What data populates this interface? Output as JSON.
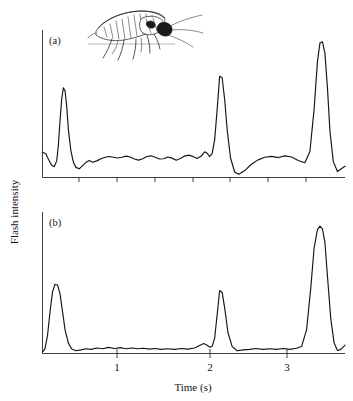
{
  "figure": {
    "background_color": "#ffffff",
    "trace_color": "#141414",
    "axis_color": "#2b2b2b",
    "y_axis_title": "Flash intensity",
    "x_axis_title": "Time (s)",
    "illustration_name": "firefly-line-drawing"
  },
  "panels": [
    {
      "id": "a",
      "label": "(a)",
      "x_tick_labels": [
        "",
        "",
        "",
        "",
        "",
        "",
        ""
      ],
      "show_tick_labels": false
    },
    {
      "id": "b",
      "label": "(b)",
      "x_tick_labels": [
        "1",
        "2",
        "3"
      ],
      "show_tick_labels": true
    }
  ],
  "chart_data": {
    "type": "line",
    "title": "",
    "xlabel": "Time (s)",
    "ylabel": "Flash intensity",
    "xlim": [
      0,
      3.62
    ],
    "ylim": [
      0,
      1.0
    ],
    "grid": false,
    "legend": null,
    "x_ticks": [
      1,
      2,
      3
    ],
    "x_tick_labels": [
      "1",
      "2",
      "3"
    ],
    "y_ticks": [],
    "y_tick_labels": [],
    "panels": [
      {
        "name": "(a)",
        "description": "Flash intensity trace with noisy baseline between flashes",
        "flash_peaks": [
          {
            "time": 0.25,
            "intensity": 0.62
          },
          {
            "time": 2.12,
            "intensity": 0.7
          },
          {
            "time": 3.35,
            "intensity": 0.94
          }
        ],
        "x": [
          0.0,
          0.04,
          0.08,
          0.11,
          0.14,
          0.17,
          0.19,
          0.21,
          0.23,
          0.25,
          0.27,
          0.29,
          0.31,
          0.34,
          0.37,
          0.4,
          0.44,
          0.48,
          0.52,
          0.56,
          0.6,
          0.65,
          0.7,
          0.75,
          0.8,
          0.85,
          0.9,
          0.95,
          1.0,
          1.05,
          1.1,
          1.15,
          1.2,
          1.25,
          1.3,
          1.35,
          1.4,
          1.45,
          1.5,
          1.55,
          1.6,
          1.65,
          1.7,
          1.75,
          1.8,
          1.85,
          1.9,
          1.94,
          1.97,
          2.0,
          2.03,
          2.06,
          2.09,
          2.12,
          2.15,
          2.18,
          2.21,
          2.25,
          2.3,
          2.35,
          2.42,
          2.5,
          2.58,
          2.66,
          2.74,
          2.82,
          2.9,
          2.98,
          3.06,
          3.14,
          3.2,
          3.25,
          3.29,
          3.32,
          3.35,
          3.38,
          3.41,
          3.44,
          3.48,
          3.53,
          3.58,
          3.62
        ],
        "y": [
          0.175,
          0.165,
          0.115,
          0.085,
          0.075,
          0.115,
          0.225,
          0.395,
          0.545,
          0.62,
          0.6,
          0.49,
          0.33,
          0.185,
          0.105,
          0.07,
          0.06,
          0.082,
          0.105,
          0.118,
          0.105,
          0.115,
          0.13,
          0.14,
          0.145,
          0.14,
          0.135,
          0.14,
          0.148,
          0.142,
          0.128,
          0.12,
          0.13,
          0.145,
          0.15,
          0.14,
          0.128,
          0.13,
          0.142,
          0.134,
          0.12,
          0.132,
          0.148,
          0.155,
          0.146,
          0.132,
          0.148,
          0.178,
          0.168,
          0.145,
          0.165,
          0.26,
          0.47,
          0.7,
          0.69,
          0.54,
          0.33,
          0.135,
          0.038,
          0.022,
          0.048,
          0.092,
          0.122,
          0.14,
          0.146,
          0.138,
          0.15,
          0.142,
          0.118,
          0.102,
          0.18,
          0.47,
          0.8,
          0.93,
          0.94,
          0.86,
          0.62,
          0.32,
          0.11,
          0.042,
          0.062,
          0.078
        ]
      },
      {
        "name": "(b)",
        "description": "Flash intensity trace with near-flat baseline between flashes",
        "flash_peaks": [
          {
            "time": 0.18,
            "intensity": 0.5
          },
          {
            "time": 2.12,
            "intensity": 0.46
          },
          {
            "time": 3.32,
            "intensity": 0.92
          }
        ],
        "x": [
          0.0,
          0.03,
          0.06,
          0.09,
          0.12,
          0.15,
          0.18,
          0.21,
          0.24,
          0.27,
          0.31,
          0.35,
          0.4,
          0.46,
          0.52,
          0.58,
          0.65,
          0.72,
          0.79,
          0.86,
          0.93,
          1.0,
          1.07,
          1.14,
          1.21,
          1.28,
          1.35,
          1.42,
          1.5,
          1.58,
          1.66,
          1.74,
          1.82,
          1.88,
          1.93,
          1.97,
          2.0,
          2.03,
          2.06,
          2.09,
          2.12,
          2.15,
          2.18,
          2.22,
          2.27,
          2.33,
          2.4,
          2.48,
          2.56,
          2.64,
          2.72,
          2.8,
          2.88,
          2.96,
          3.04,
          3.1,
          3.16,
          3.21,
          3.25,
          3.29,
          3.32,
          3.35,
          3.38,
          3.41,
          3.45,
          3.49,
          3.53,
          3.57,
          3.62
        ],
        "y": [
          0.01,
          0.035,
          0.13,
          0.3,
          0.445,
          0.5,
          0.495,
          0.43,
          0.3,
          0.17,
          0.075,
          0.032,
          0.02,
          0.026,
          0.034,
          0.03,
          0.04,
          0.034,
          0.044,
          0.036,
          0.042,
          0.034,
          0.04,
          0.034,
          0.038,
          0.032,
          0.036,
          0.03,
          0.034,
          0.03,
          0.036,
          0.032,
          0.04,
          0.058,
          0.072,
          0.06,
          0.046,
          0.052,
          0.11,
          0.28,
          0.455,
          0.44,
          0.33,
          0.15,
          0.05,
          0.02,
          0.026,
          0.03,
          0.036,
          0.03,
          0.034,
          0.03,
          0.036,
          0.03,
          0.038,
          0.05,
          0.17,
          0.47,
          0.76,
          0.895,
          0.92,
          0.9,
          0.8,
          0.56,
          0.25,
          0.075,
          0.022,
          0.03,
          0.06
        ]
      }
    ]
  }
}
